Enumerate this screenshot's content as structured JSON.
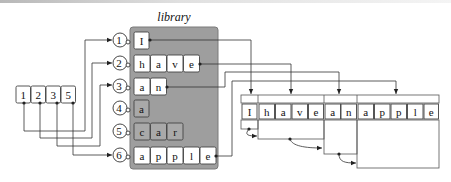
{
  "diagram": {
    "library_title": "library",
    "colors": {
      "panel": "#9e9e9e",
      "panel_border": "#7a7a7a",
      "cell_active": "#ffffff",
      "cell_inactive": "#a9a9a9",
      "line": "#333333"
    },
    "index_array": {
      "values": [
        "1",
        "2",
        "3",
        "5"
      ]
    },
    "library_entries": [
      {
        "id": "1",
        "chars": [
          "I"
        ],
        "used": true
      },
      {
        "id": "2",
        "chars": [
          "h",
          "a",
          "v",
          "e"
        ],
        "used": true
      },
      {
        "id": "3",
        "chars": [
          "a",
          "n"
        ],
        "used": true
      },
      {
        "id": "4",
        "chars": [
          "a"
        ],
        "used": false
      },
      {
        "id": "5",
        "chars": [
          "c",
          "a",
          "r"
        ],
        "used": false
      },
      {
        "id": "6",
        "chars": [
          "a",
          "p",
          "p",
          "l",
          "e"
        ],
        "used": true
      }
    ],
    "output_sequence": {
      "chars": [
        "I",
        "h",
        "a",
        "v",
        "e",
        "a",
        "n",
        "a",
        "p",
        "p",
        "l",
        "e"
      ],
      "words": [
        "I",
        "have",
        "an",
        "apple"
      ]
    }
  }
}
